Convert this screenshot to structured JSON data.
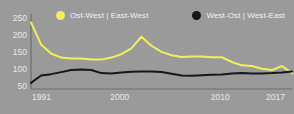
{
  "legend": {
    "position": "top",
    "entries": [
      {
        "label": "Ost-West | East-West",
        "color": "#f2ef5a",
        "marker": "circle"
      },
      {
        "label": "West-Ost | West-East",
        "color": "#16161e",
        "marker": "circle"
      }
    ]
  },
  "colors": {
    "background": "#9a9a9a",
    "axis": "#6e6e72",
    "text": "#e8e8e8",
    "series_east_west": "#f2ef5a",
    "series_west_east": "#16161e"
  },
  "chart_data": {
    "type": "line",
    "title": "",
    "subtitle": "",
    "xlabel": "",
    "ylabel": "",
    "xlim": [
      1991,
      2017
    ],
    "ylim": [
      40,
      262
    ],
    "grid": false,
    "legend_position": "top",
    "x_ticks": [
      "1991",
      "2000",
      "2010",
      "2017"
    ],
    "x_tick_values": [
      1991,
      2000,
      2010,
      2017
    ],
    "y_ticks": [
      "50",
      "100",
      "150",
      "200",
      "250"
    ],
    "y_tick_values": [
      50,
      100,
      150,
      200,
      250
    ],
    "x": [
      1991,
      1992,
      1993,
      1994,
      1995,
      1996,
      1997,
      1998,
      1999,
      2000,
      2001,
      2002,
      2003,
      2004,
      2005,
      2006,
      2007,
      2008,
      2009,
      2010,
      2011,
      2012,
      2013,
      2014,
      2015,
      2016,
      2017
    ],
    "series": [
      {
        "name": "Ost-West | East-West",
        "color": "#f2ef5a",
        "values": [
          237,
          172,
          145,
          133,
          130,
          130,
          127,
          127,
          133,
          143,
          160,
          195,
          168,
          150,
          140,
          135,
          136,
          136,
          134,
          134,
          120,
          110,
          108,
          100,
          96,
          108,
          87
        ]
      },
      {
        "name": "West-Ost | West-East",
        "color": "#16161e",
        "values": [
          58,
          80,
          84,
          90,
          96,
          98,
          96,
          87,
          86,
          89,
          91,
          92,
          92,
          90,
          85,
          80,
          79,
          81,
          82,
          83,
          86,
          87,
          86,
          86,
          87,
          89,
          92
        ]
      }
    ]
  }
}
